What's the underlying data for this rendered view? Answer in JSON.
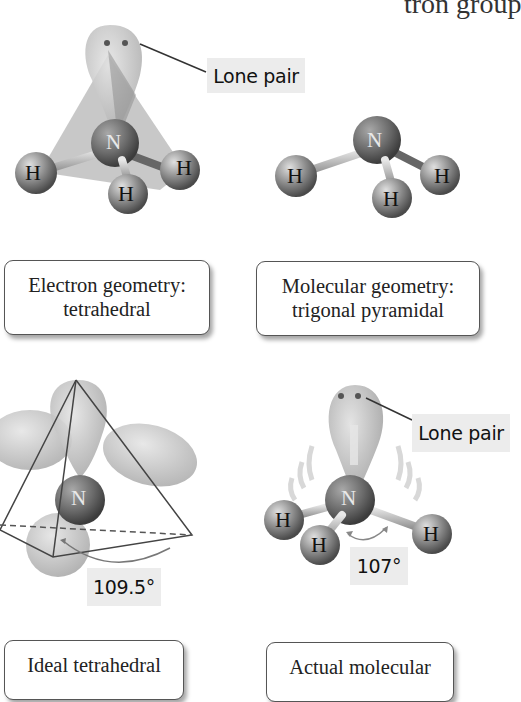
{
  "header": {
    "partial_text": "tron group"
  },
  "panels": [
    {
      "id": "electron-geometry",
      "labels": {
        "lone_pair": "Lone pair"
      },
      "atoms": {
        "central": "N",
        "h1": "H",
        "h2": "H",
        "h3": "H"
      },
      "caption": {
        "line1": "Electron geometry:",
        "line2": "tetrahedral"
      }
    },
    {
      "id": "molecular-geometry",
      "atoms": {
        "central": "N",
        "h1": "H",
        "h2": "H",
        "h3": "H"
      },
      "caption": {
        "line1": "Molecular geometry:",
        "line2": "trigonal pyramidal"
      }
    },
    {
      "id": "ideal-tetrahedral",
      "atoms": {
        "central": "N"
      },
      "angle": "109.5°",
      "caption": {
        "line1": "Ideal tetrahedral"
      }
    },
    {
      "id": "actual-molecular",
      "labels": {
        "lone_pair": "Lone pair"
      },
      "atoms": {
        "central": "N",
        "h1": "H",
        "h2": "H",
        "h3": "H"
      },
      "angle": "107°",
      "caption": {
        "line1": "Actual molecular"
      }
    }
  ],
  "colors": {
    "lobe": "#c9c9c9",
    "atom_n": "#6e6e6e",
    "atom_h": "#8a8a8a",
    "label_bg": "#ececec",
    "line": "#444444"
  }
}
